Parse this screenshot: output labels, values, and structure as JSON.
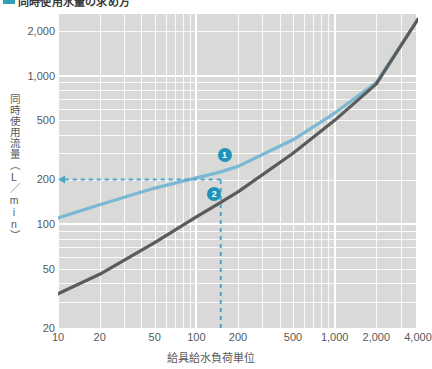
{
  "heading": {
    "title": "同時使用水量の求め方",
    "accent_color": "#2f9fb5"
  },
  "chart_data": {
    "type": "line",
    "title": "同時使用水量の求め方",
    "xlabel": "給具給水負荷単位",
    "ylabel": "同時使用流量（L／min）",
    "xscale": "log",
    "yscale": "log",
    "xlim": [
      10,
      4000
    ],
    "ylim": [
      20,
      2600
    ],
    "grid": true,
    "legend": "none",
    "xticks": [
      "10",
      "20",
      "50",
      "100",
      "200",
      "500",
      "1,000",
      "2,000",
      "4,000"
    ],
    "xtick_values": [
      10,
      20,
      50,
      100,
      200,
      500,
      1000,
      2000,
      4000
    ],
    "yticks": [
      "20",
      "50",
      "100",
      "200",
      "500",
      "1,000",
      "2,000"
    ],
    "ytick_values": [
      20,
      50,
      100,
      200,
      500,
      1000,
      2000
    ],
    "series": [
      {
        "name": "curve-1-flush-valve",
        "color": "#7bb8d4",
        "points": [
          {
            "x": 10,
            "y": 110
          },
          {
            "x": 20,
            "y": 135
          },
          {
            "x": 50,
            "y": 175
          },
          {
            "x": 100,
            "y": 205
          },
          {
            "x": 150,
            "y": 225
          },
          {
            "x": 200,
            "y": 245
          },
          {
            "x": 500,
            "y": 370
          },
          {
            "x": 1000,
            "y": 560
          },
          {
            "x": 2000,
            "y": 900
          },
          {
            "x": 4000,
            "y": 2400
          }
        ]
      },
      {
        "name": "curve-2-tank-type",
        "color": "#5b5b5b",
        "points": [
          {
            "x": 10,
            "y": 34
          },
          {
            "x": 20,
            "y": 46
          },
          {
            "x": 50,
            "y": 75
          },
          {
            "x": 100,
            "y": 112
          },
          {
            "x": 150,
            "y": 140
          },
          {
            "x": 200,
            "y": 165
          },
          {
            "x": 500,
            "y": 300
          },
          {
            "x": 1000,
            "y": 500
          },
          {
            "x": 2000,
            "y": 880
          },
          {
            "x": 4000,
            "y": 2400
          }
        ]
      }
    ],
    "annotations": [
      {
        "name": "marker-1",
        "label": "❶",
        "text": "1",
        "x": 160,
        "y": 290,
        "color": "#1f93b8"
      },
      {
        "name": "marker-2",
        "label": "❷",
        "text": "2",
        "x": 135,
        "y": 160,
        "color": "#1f93b8"
      },
      {
        "name": "readout-vertical",
        "kind": "dashed-line",
        "x": 150,
        "from_y": 20,
        "to_y": 200,
        "color": "#4aa8c9"
      },
      {
        "name": "readout-horizontal",
        "kind": "dashed-arrow",
        "y": 200,
        "from_x": 150,
        "to_x": 10,
        "color": "#4aa8c9"
      }
    ]
  }
}
